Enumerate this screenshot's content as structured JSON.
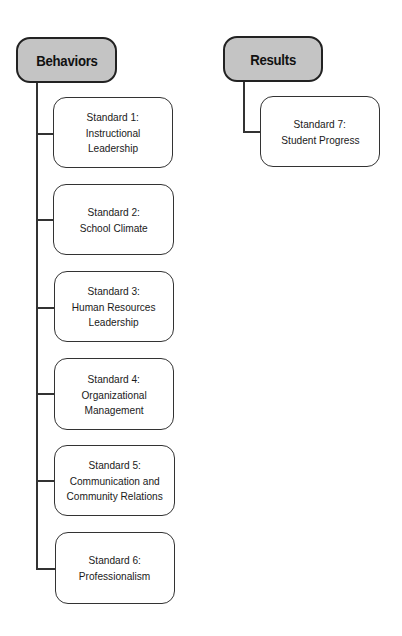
{
  "diagram": {
    "groups": [
      {
        "label": "Behaviors",
        "standards": [
          {
            "title": "Standard 1:",
            "name": "Instructional\nLeadership"
          },
          {
            "title": "Standard 2:",
            "name": "School Climate"
          },
          {
            "title": "Standard 3:",
            "name": "Human Resources\nLeadership"
          },
          {
            "title": "Standard 4:",
            "name": "Organizational\nManagement"
          },
          {
            "title": "Standard 5:",
            "name": "Communication and\nCommunity Relations"
          },
          {
            "title": "Standard 6:",
            "name": "Professionalism"
          }
        ]
      },
      {
        "label": "Results",
        "standards": [
          {
            "title": "Standard 7:",
            "name": "Student Progress"
          }
        ]
      }
    ],
    "colors": {
      "header_fill": "#c4c4c4",
      "box_fill": "#ffffff",
      "stroke": "#333333"
    }
  }
}
